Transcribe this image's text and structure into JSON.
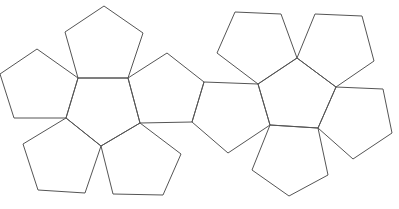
{
  "diagram": {
    "type": "dodecahedron-net",
    "stroke_color": "#555555",
    "background": "#ffffff",
    "faces": [
      {
        "id": "left-center",
        "points": "78,78 128,78 140,123 101,146 66,118"
      },
      {
        "id": "left-top",
        "points": "104,6 143,33 128,78 78,78 65,32"
      },
      {
        "id": "left-left",
        "points": "37,49 78,78 66,118 14,118 0,74"
      },
      {
        "id": "left-right",
        "points": "128,78 167,53 204,82 192,122 140,123"
      },
      {
        "id": "left-bottom-left",
        "points": "66,118 101,146 85,193 38,190 23,144"
      },
      {
        "id": "left-bottom-right",
        "points": "101,146 140,123 181,154 163,195 113,194"
      },
      {
        "id": "right-bridge",
        "points": "204,82 258,84 270,125 228,153 192,122"
      },
      {
        "id": "right-center",
        "points": "258,84 297,58 336,87 318,128 270,125"
      },
      {
        "id": "right-top-left",
        "points": "235,12 281,14 297,58 258,84 217,53"
      },
      {
        "id": "right-top-right",
        "points": "315,14 362,16 374,61 336,87 297,58"
      },
      {
        "id": "right-right",
        "points": "336,87 383,89 392,133 353,159 318,128"
      },
      {
        "id": "right-bottom",
        "points": "270,125 318,128 328,175 289,196 252,170"
      }
    ]
  }
}
